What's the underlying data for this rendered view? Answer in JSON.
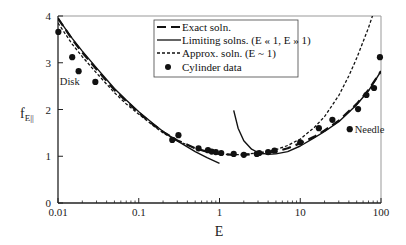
{
  "chart_data": {
    "type": "line",
    "title": "",
    "xlabel": "E",
    "ylabel": "f",
    "ylabel_subscript": "E||",
    "xscale": "log",
    "xlim": [
      0.01,
      100
    ],
    "ylim": [
      0,
      4
    ],
    "grid": false,
    "x_ticks": [
      {
        "value": 0.01,
        "label": "0.01"
      },
      {
        "value": 0.1,
        "label": "0.1"
      },
      {
        "value": 1,
        "label": "1"
      },
      {
        "value": 10,
        "label": "10"
      },
      {
        "value": 100,
        "label": "100"
      }
    ],
    "y_ticks": [
      {
        "value": 0,
        "label": "0"
      },
      {
        "value": 1,
        "label": "1"
      },
      {
        "value": 2,
        "label": "2"
      },
      {
        "value": 3,
        "label": "3"
      },
      {
        "value": 4,
        "label": "4"
      }
    ],
    "legend_position": "top-right",
    "legend": [
      {
        "name": "Exact soln.",
        "style": "long-dash"
      },
      {
        "name": "Limiting solns. (E « 1, E » 1)",
        "style": "solid"
      },
      {
        "name": "Approx. soln. (E ~ 1)",
        "style": "short-dash"
      },
      {
        "name": "Cylinder data",
        "style": "marker"
      }
    ],
    "annotations": [
      {
        "text": "Disk",
        "x": 0.014,
        "y": 2.6
      },
      {
        "text": "Needle",
        "x": 50,
        "y": 1.25
      }
    ],
    "series": [
      {
        "name": "Exact soln.",
        "style": "long-dash",
        "x": [
          0.01,
          0.015,
          0.02,
          0.03,
          0.05,
          0.07,
          0.1,
          0.15,
          0.2,
          0.3,
          0.5,
          0.7,
          1,
          1.5,
          2,
          3,
          5,
          7,
          10,
          15,
          20,
          30,
          50,
          70,
          100
        ],
        "y": [
          3.95,
          3.5,
          3.22,
          2.86,
          2.42,
          2.18,
          1.93,
          1.68,
          1.52,
          1.34,
          1.17,
          1.1,
          1.05,
          1.03,
          1.03,
          1.05,
          1.1,
          1.17,
          1.28,
          1.42,
          1.55,
          1.76,
          2.12,
          2.42,
          2.82
        ]
      },
      {
        "name": "Limiting soln. (E « 1)",
        "style": "solid",
        "x": [
          0.01,
          0.015,
          0.02,
          0.03,
          0.05,
          0.07,
          0.1,
          0.15,
          0.2,
          0.3,
          0.5,
          0.7,
          1
        ],
        "y": [
          3.95,
          3.52,
          3.25,
          2.89,
          2.45,
          2.2,
          1.95,
          1.7,
          1.53,
          1.33,
          1.1,
          0.97,
          0.85
        ]
      },
      {
        "name": "Limiting soln. (E » 1)",
        "style": "solid",
        "x": [
          1.5,
          1.7,
          2,
          2.5,
          3,
          4,
          5,
          7,
          10,
          15,
          20,
          30,
          50,
          70,
          100
        ],
        "y": [
          1.98,
          1.6,
          1.33,
          1.15,
          1.08,
          1.04,
          1.05,
          1.1,
          1.22,
          1.4,
          1.53,
          1.74,
          2.1,
          2.4,
          2.82
        ]
      },
      {
        "name": "Approx. soln. (E ~ 1)",
        "style": "short-dash",
        "x": [
          0.01,
          0.015,
          0.02,
          0.03,
          0.05,
          0.07,
          0.1,
          0.15,
          0.2,
          0.3,
          0.5,
          0.7,
          1,
          1.5,
          2,
          3,
          5,
          7,
          10,
          15,
          20,
          30,
          40,
          50,
          60,
          70,
          80,
          90
        ],
        "y": [
          3.85,
          3.4,
          3.13,
          2.78,
          2.36,
          2.12,
          1.9,
          1.66,
          1.5,
          1.33,
          1.17,
          1.1,
          1.05,
          1.03,
          1.04,
          1.07,
          1.14,
          1.23,
          1.37,
          1.62,
          1.85,
          2.3,
          2.72,
          3.1,
          3.45,
          3.75,
          4.05,
          4.3
        ]
      },
      {
        "name": "Cylinder data",
        "style": "marker",
        "x": [
          0.0101,
          0.015,
          0.018,
          0.029,
          0.26,
          0.31,
          0.55,
          0.72,
          0.8,
          0.9,
          1.05,
          1.5,
          2,
          2.9,
          3.1,
          4,
          4.8,
          10,
          17,
          25,
          41,
          52,
          66,
          82,
          97
        ],
        "y": [
          3.66,
          3.12,
          2.82,
          2.59,
          1.35,
          1.45,
          1.17,
          1.13,
          1.1,
          1.09,
          1.07,
          1.05,
          1.03,
          1.05,
          1.07,
          1.09,
          1.12,
          1.3,
          1.6,
          1.78,
          1.58,
          2.01,
          2.31,
          2.46,
          3.12
        ]
      }
    ]
  }
}
